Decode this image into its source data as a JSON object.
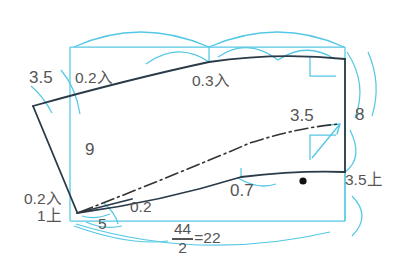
{
  "figure": {
    "type": "pattern-drafting-diagram",
    "colors": {
      "construction_line": "#54c8e4",
      "pattern_outline": "#2b3a48",
      "center_line": "#333333",
      "text": "#555555",
      "background": "#ffffff",
      "marker_dot": "#111111"
    }
  },
  "labels": {
    "left_shoulder_measure": "3.5",
    "ease_left": "0.2入",
    "ease_center": "0.3入",
    "side_height": "9",
    "right_height": "8",
    "right_arrow_measure": "3.5",
    "right_bottom_note": "3.5上",
    "underarm_curve": "0.7",
    "hem_ease": "0.2",
    "hem_start": "5",
    "bottom_left_ease": "0.2入",
    "bottom_left_raise": "1上"
  },
  "fraction": {
    "numerator": "44",
    "denominator": "2",
    "equals": "=22"
  },
  "markers": {
    "right_angle_symbol": "right-angle",
    "balance_dot": "●"
  },
  "caption": {
    "text": ""
  }
}
